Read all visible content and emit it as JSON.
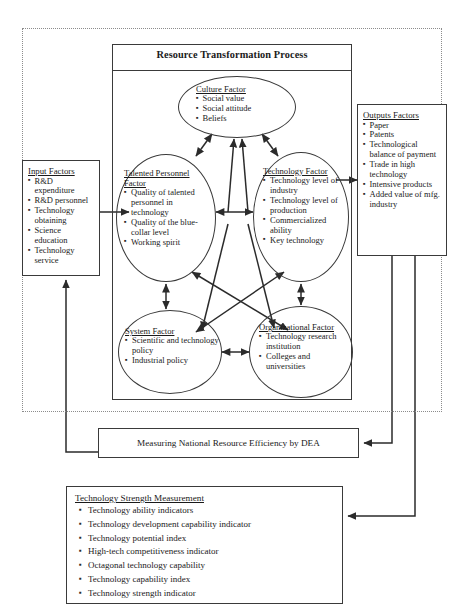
{
  "diagram": {
    "title": "Resource Transformation Process",
    "boundary_style": "dotted"
  },
  "colors": {
    "line": "#3a3a3a",
    "dashed_boundary": "#8c8c8c",
    "text": "#1a1a1a",
    "background": "#ffffff"
  },
  "input_factors": {
    "title": "Input Factors",
    "items": [
      "R&D expenditure",
      "R&D personnel",
      "Technology obtaining",
      "Science education",
      "Technology service"
    ]
  },
  "output_factors": {
    "title": "Outputs Factors",
    "items": [
      "Paper",
      "Patents",
      "Technological balance of payment",
      "Trade in high technology",
      "Intensive products",
      "Added value of mfg. industry"
    ]
  },
  "nodes": {
    "culture": {
      "title": "Culture Factor",
      "items": [
        "Social value",
        "Social attitude",
        "Beliefs"
      ]
    },
    "talented_personnel": {
      "title": "Talented Personnel Factor",
      "items": [
        "Quality of talented personnel in technology",
        "Quality of the blue-collar level",
        "Working spirit"
      ]
    },
    "technology": {
      "title": "Technology Factor",
      "items": [
        "Technology level of industry",
        "Technology level of production",
        "Commercialized ability",
        "Key technology"
      ]
    },
    "system": {
      "title": "System Factor",
      "items": [
        "Scientific and technology policy",
        "Industrial policy"
      ]
    },
    "organizational": {
      "title": "Organizational Factor",
      "items": [
        "Technology research institution",
        "Colleges and universities"
      ]
    }
  },
  "dea": {
    "label": "Measuring National Resource Efficiency by DEA"
  },
  "technology_strength_measurement": {
    "title": "Technology Strength Measurement",
    "items": [
      "Technology ability indicators",
      "Technology development capability indicator",
      "Technology potential index",
      "High-tech competitiveness indicator",
      "Octagonal technology capability",
      "Technology capability index",
      "Technology strength indicator"
    ]
  }
}
